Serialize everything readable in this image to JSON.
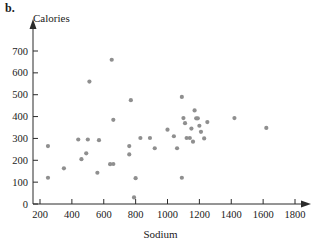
{
  "figure": {
    "part_label": "b.",
    "point_color": "#8f8f8f",
    "axis_color": "#2b2b2b"
  },
  "chart_data": {
    "type": "scatter",
    "title": "",
    "xlabel": "Sodium",
    "ylabel": "Calories",
    "xlim": [
      150,
      1850
    ],
    "ylim": [
      0,
      740
    ],
    "xticks": [
      200,
      400,
      600,
      800,
      1000,
      1200,
      1400,
      1600,
      1800
    ],
    "yticks": [
      0,
      100,
      200,
      300,
      400,
      500,
      600,
      700
    ],
    "grid": false,
    "legend": null,
    "x": [
      250,
      250,
      350,
      440,
      460,
      490,
      500,
      510,
      560,
      570,
      640,
      650,
      660,
      660,
      760,
      760,
      770,
      790,
      800,
      830,
      890,
      920,
      1000,
      1040,
      1060,
      1090,
      1090,
      1100,
      1110,
      1120,
      1140,
      1150,
      1160,
      1170,
      1180,
      1190,
      1200,
      1210,
      1230,
      1250,
      1420,
      1620
    ],
    "y": [
      120,
      265,
      163,
      295,
      205,
      232,
      295,
      560,
      143,
      292,
      182,
      660,
      183,
      385,
      227,
      265,
      475,
      30,
      118,
      302,
      302,
      255,
      340,
      310,
      255,
      120,
      490,
      393,
      370,
      302,
      302,
      345,
      285,
      428,
      392,
      392,
      358,
      330,
      300,
      375,
      393,
      348
    ]
  }
}
